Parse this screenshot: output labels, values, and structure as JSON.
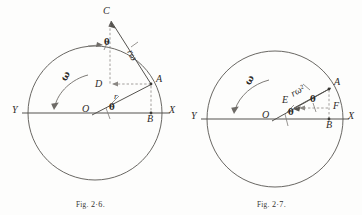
{
  "figures": [
    {
      "id": "fig-2-6",
      "caption_prefix": "Fig.",
      "caption_number": "2·6.",
      "caption_full": "Fig. 2·6.",
      "axis_left_label": "Y",
      "axis_right_label": "X",
      "points": {
        "O": "O",
        "A": "A",
        "B": "B",
        "C": "C",
        "D": "D"
      },
      "vector_label": "rω",
      "radius_label": "r",
      "angle_label_at_center": "θ",
      "angle_label_at_top": "θ",
      "omega_label": "ω",
      "geometry": {
        "circle_center_x": 95,
        "circle_center_y": 113,
        "circle_radius": 67,
        "axis_y": 113,
        "axis_x_start": 22,
        "axis_x_end": 170,
        "point_A_x": 151,
        "point_A_y": 84,
        "point_B_x": 151,
        "point_B_y": 113,
        "point_C_x": 110,
        "point_C_y": 16,
        "point_D_x": 110,
        "point_D_y": 84
      }
    },
    {
      "id": "fig-2-7",
      "caption_prefix": "Fig.",
      "caption_number": "2·7.",
      "caption_full": "Fig. 2·7.",
      "axis_left_label": "Y",
      "axis_right_label": "X",
      "points": {
        "O": "O",
        "A": "A",
        "B": "B",
        "E": "E",
        "F": "F"
      },
      "vector_label": "rω²",
      "angle_label_at_center": "θ",
      "angle_label_at_A": "θ",
      "omega_label": "ω",
      "geometry": {
        "circle_center_x": 94,
        "circle_center_y": 119,
        "circle_radius": 68,
        "axis_y": 119,
        "axis_x_start": 20,
        "axis_x_end": 168,
        "point_A_x": 148,
        "point_A_y": 89,
        "point_B_x": 148,
        "point_B_y": 119,
        "point_E_x": 113,
        "point_E_y": 108,
        "point_F_x": 148,
        "point_F_y": 108
      }
    }
  ],
  "colors": {
    "ink": "#4a4845",
    "ink_dark": "#2e2b29",
    "background": "#fdfdfc",
    "dashed": "#7d7a76"
  }
}
